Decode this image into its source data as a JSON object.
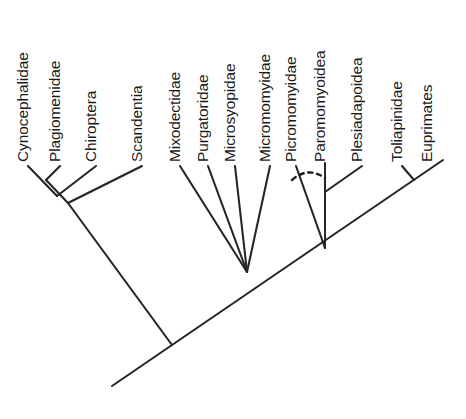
{
  "diagram": {
    "type": "cladogram",
    "title": "",
    "orientation": "diagonal-ascending",
    "label_rotation_deg": -90,
    "colors": {
      "background": "#ffffff",
      "line": "#262626",
      "text": "#1a1a1a",
      "uncertain_line": "#1f1f1f"
    },
    "taxa": [
      {
        "id": "cynocephalidae",
        "label": "Cynocephalidae",
        "x": 28,
        "y": 162
      },
      {
        "id": "plagiomenidae",
        "label": "Plagiomenidae",
        "x": 60,
        "y": 162
      },
      {
        "id": "chiroptera",
        "label": "Chiroptera",
        "x": 96,
        "y": 162
      },
      {
        "id": "scandentia",
        "label": "Scandentia",
        "x": 142,
        "y": 162
      },
      {
        "id": "mixodectidae",
        "label": "Mixodectidae",
        "x": 180,
        "y": 162
      },
      {
        "id": "purgatoridae",
        "label": "Purgatoridae",
        "x": 208,
        "y": 162
      },
      {
        "id": "microsyopidae",
        "label": "Microsyopidae",
        "x": 235,
        "y": 162
      },
      {
        "id": "micromomyidae",
        "label": "Micromomyidae",
        "x": 270,
        "y": 162
      },
      {
        "id": "picromomyidae",
        "label": "Picromomyidae",
        "x": 296,
        "y": 162
      },
      {
        "id": "paromomyoidea",
        "label": "Paromomyoidea",
        "x": 325,
        "y": 162
      },
      {
        "id": "plesiadapoidea",
        "label": "Plesiadapoidea",
        "x": 362,
        "y": 162
      },
      {
        "id": "toliapinidae",
        "label": "Toliapinidae",
        "x": 402,
        "y": 162
      },
      {
        "id": "euprimates",
        "label": "Euprimates",
        "x": 432,
        "y": 162
      }
    ],
    "branches": [
      {
        "id": "branch-cynocephalidae",
        "from": [
          28,
          166
        ],
        "to": [
          57,
          196
        ]
      },
      {
        "id": "branch-plagiomenidae",
        "from": [
          60,
          166
        ],
        "to": [
          46,
          180
        ]
      },
      {
        "id": "node-cyno-plagio-stem",
        "from": [
          46,
          180
        ],
        "to": [
          68,
          203
        ]
      },
      {
        "id": "branch-chiroptera",
        "from": [
          96,
          166
        ],
        "to": [
          57,
          196
        ]
      },
      {
        "id": "branch-scandentia",
        "from": [
          142,
          166
        ],
        "to": [
          68,
          203
        ]
      },
      {
        "id": "clade-dermoptera-stem",
        "from": [
          68,
          203
        ],
        "to": [
          172,
          345
        ]
      },
      {
        "id": "branch-mixodectidae",
        "from": [
          180,
          166
        ],
        "to": [
          247,
          272
        ]
      },
      {
        "id": "branch-purgatoridae",
        "from": [
          208,
          166
        ],
        "to": [
          247,
          272
        ]
      },
      {
        "id": "branch-microsyopidae",
        "from": [
          235,
          166
        ],
        "to": [
          247,
          272
        ]
      },
      {
        "id": "branch-micromomyidae",
        "from": [
          270,
          166
        ],
        "to": [
          247,
          272
        ]
      },
      {
        "id": "branch-picromomyidae",
        "from": [
          296,
          166
        ],
        "to": [
          325,
          248
        ]
      },
      {
        "id": "branch-paromomyoidea",
        "from": [
          325,
          163
        ],
        "to": [
          325,
          248
        ]
      },
      {
        "id": "branch-plesiadapoidea",
        "from": [
          362,
          166
        ],
        "to": [
          325,
          192
        ]
      },
      {
        "id": "branch-toliapinidae",
        "from": [
          402,
          166
        ],
        "to": [
          414,
          180
        ]
      },
      {
        "id": "main-diagonal-spine",
        "from": [
          172,
          345
        ],
        "to": [
          443,
          160
        ]
      },
      {
        "id": "root-stem",
        "from": [
          172,
          345
        ],
        "to": [
          112,
          386
        ]
      }
    ],
    "uncertain_links": [
      {
        "id": "picromomyidae-paromomyoidea-uncertain",
        "path": "M 292 180 Q 308 166 325 178"
      }
    ],
    "notes": {
      "polytomy_node": "Mixodectidae, Purgatoridae, Microsyopidae and Micromomyidae converge at a single polytomy.",
      "dashed_meaning": "Dotted arc indicates uncertain relationship between Picromomyidae and Paromomyoidea."
    }
  }
}
